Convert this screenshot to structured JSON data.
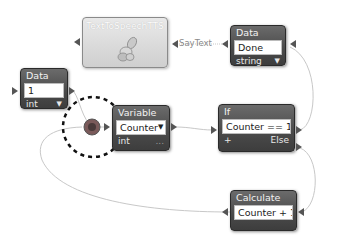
{
  "nodes": {
    "tts": {
      "title": "TextToSpeechTTS",
      "icon": "hand-speech-icon"
    },
    "data_done": {
      "title": "Data",
      "value": "Done",
      "type": "string",
      "dropdown": "▼"
    },
    "data_one": {
      "title": "Data",
      "value": "1",
      "type": "int",
      "dropdown": "▼"
    },
    "variable": {
      "title": "Variable",
      "value": "Counter",
      "dropdown": "▼",
      "type": "int",
      "more": "..."
    },
    "if_node": {
      "title": "If",
      "condition": "Counter == 10",
      "add": "+",
      "else_label": "Else"
    },
    "calculate": {
      "title": "Calculate",
      "expression": "Counter + 1"
    }
  },
  "connections": {
    "say_text_label": "SayText"
  },
  "colors": {
    "node_dark": "#4a4a4a",
    "node_border": "#2a2a2a",
    "wire": "#c8c8c8",
    "tts_bg": "#dcdcdc",
    "highlight_circle": "#111111"
  }
}
